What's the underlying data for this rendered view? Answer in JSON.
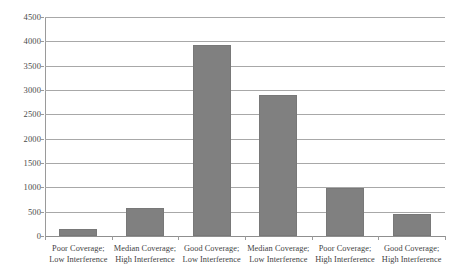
{
  "chart_data": {
    "type": "bar",
    "title": "",
    "subtitle": "",
    "xlabel": "",
    "ylabel": "",
    "categories": [
      "Poor Coverage; Low Interference",
      "Median Coverage; High Interference",
      "Good Coverage; Low Interference",
      "Median Coverage; Low Interference",
      "Poor Coverage; High Interference",
      "Good Coverage; High Interference"
    ],
    "category_lines": [
      {
        "line1": "Poor Coverage;",
        "line2": "Low Interference"
      },
      {
        "line1": "Median Coverage;",
        "line2": "High Interference"
      },
      {
        "line1": "Good Coverage;",
        "line2": "Low Interference"
      },
      {
        "line1": "Median Coverage;",
        "line2": "Low Interference"
      },
      {
        "line1": "Poor Coverage;",
        "line2": "High Interference"
      },
      {
        "line1": "Good Coverage;",
        "line2": "High Interference"
      }
    ],
    "values": [
      150,
      570,
      3930,
      2890,
      990,
      460
    ],
    "ylim": [
      0,
      4500
    ],
    "ytick_step": 500,
    "ytick_labels": [
      "4500",
      "4000",
      "3500",
      "3000",
      "2500",
      "2000",
      "1500",
      "1000",
      "500",
      "0"
    ],
    "ytick_values": [
      4500,
      4000,
      3500,
      3000,
      2500,
      2000,
      1500,
      1000,
      500,
      0
    ],
    "grid": "horizontal",
    "legend": "none",
    "bar_color": "#808080",
    "grid_color": "#a8a8a8",
    "axis_color": "#9a9a9a"
  }
}
